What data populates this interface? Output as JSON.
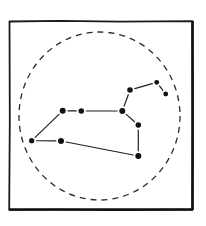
{
  "diagram": {
    "frame": {
      "x1": 9,
      "y1": 21,
      "x2": 193,
      "y2": 210,
      "color": "#1a1a1a"
    },
    "boundary_circle": {
      "cx": 99.5,
      "cy": 116,
      "rx": 80.5,
      "ry": 84,
      "style": "dashed",
      "color": "#2a2a2a"
    },
    "stars": [
      {
        "id": "A",
        "x": 31.7,
        "y": 140.7,
        "r": 2.6
      },
      {
        "id": "B",
        "x": 61.0,
        "y": 141.0,
        "r": 3.0
      },
      {
        "id": "C",
        "x": 62.7,
        "y": 110.7,
        "r": 3.0
      },
      {
        "id": "D",
        "x": 81.3,
        "y": 111.0,
        "r": 2.8
      },
      {
        "id": "E",
        "x": 122.3,
        "y": 111.0,
        "r": 3.0
      },
      {
        "id": "F",
        "x": 138.3,
        "y": 125.0,
        "r": 2.8
      },
      {
        "id": "G",
        "x": 138.3,
        "y": 156.0,
        "r": 3.0
      },
      {
        "id": "H",
        "x": 130.0,
        "y": 90.0,
        "r": 2.8
      },
      {
        "id": "I",
        "x": 156.7,
        "y": 82.3,
        "r": 2.4
      },
      {
        "id": "J",
        "x": 165.7,
        "y": 94.0,
        "r": 2.4
      }
    ],
    "links": [
      {
        "from": "A",
        "to": "C"
      },
      {
        "from": "A",
        "to": "B"
      },
      {
        "from": "C",
        "to": "D"
      },
      {
        "from": "D",
        "to": "E"
      },
      {
        "from": "B",
        "to": "G"
      },
      {
        "from": "E",
        "to": "F"
      },
      {
        "from": "F",
        "to": "G"
      },
      {
        "from": "E",
        "to": "H"
      },
      {
        "from": "H",
        "to": "I"
      },
      {
        "from": "I",
        "to": "J"
      }
    ],
    "star_color": "#111111",
    "line_color": "#1f1f1f"
  }
}
